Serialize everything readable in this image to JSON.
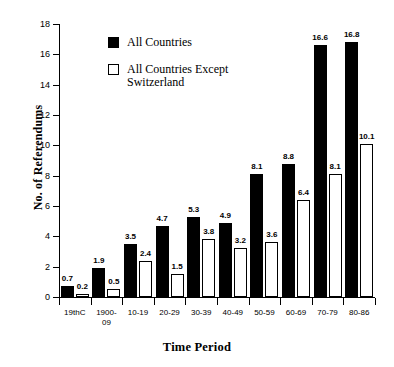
{
  "chart_data": {
    "type": "bar",
    "title": "",
    "xlabel": "Time Period",
    "ylabel": "No. of Referendums",
    "ylim": [
      0,
      18
    ],
    "yticks": [
      0,
      2,
      4,
      6,
      8,
      10,
      12,
      14,
      16,
      18
    ],
    "grid": false,
    "legend_position": "top-left-inside",
    "categories": [
      "19thC",
      "1900-\n09",
      "10-19",
      "20-29",
      "30-39",
      "40-49",
      "50-59",
      "60-69",
      "70-79",
      "80-86"
    ],
    "series": [
      {
        "name": "All Countries",
        "style": "filled",
        "color": "#000000",
        "values": [
          0.7,
          1.9,
          3.5,
          4.7,
          5.3,
          4.9,
          8.1,
          8.8,
          16.6,
          16.8
        ]
      },
      {
        "name": "All Countries Except\nSwitzerland",
        "style": "hollow",
        "color": "#ffffff",
        "values": [
          0.2,
          0.5,
          2.4,
          1.5,
          3.8,
          3.2,
          3.6,
          6.4,
          8.1,
          10.1
        ]
      }
    ]
  },
  "legend": {
    "entries": [
      {
        "label": "All Countries",
        "style": "filled"
      },
      {
        "label": "All Countries Except\nSwitzerland",
        "style": "hollow"
      }
    ]
  },
  "axes": {
    "y_title": "No. of Referendums",
    "x_title": "Time Period",
    "y_tick_labels": [
      "0",
      "2",
      "4",
      "6",
      "8",
      "10",
      "12",
      "14",
      "16",
      "18"
    ],
    "x_tick_labels": [
      "19thC",
      "1900-\n09",
      "10-19",
      "20-29",
      "30-39",
      "40-49",
      "50-59",
      "60-69",
      "70-79",
      "80-86"
    ]
  }
}
